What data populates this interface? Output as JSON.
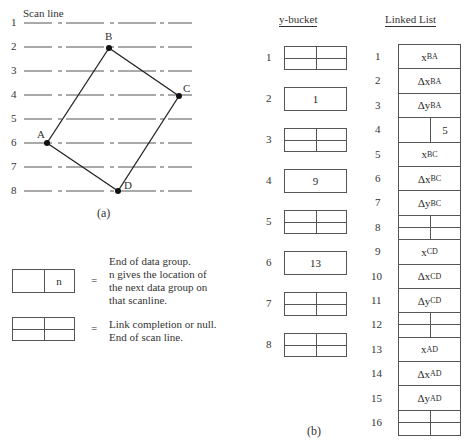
{
  "panel_a": {
    "caption": "(a)",
    "scan_line_label": "Scan line",
    "scan_lines": [
      "1",
      "2",
      "3",
      "4",
      "5",
      "6",
      "7",
      "8"
    ],
    "vertices": [
      {
        "name": "B",
        "x": 109,
        "y": 48
      },
      {
        "name": "C",
        "x": 179,
        "y": 96
      },
      {
        "name": "A",
        "x": 47,
        "y": 143
      },
      {
        "name": "D",
        "x": 118,
        "y": 191
      }
    ],
    "edges": [
      [
        "A",
        "B"
      ],
      [
        "B",
        "C"
      ],
      [
        "C",
        "D"
      ],
      [
        "D",
        "A"
      ]
    ]
  },
  "legend": {
    "end_group": {
      "cell_value": "n",
      "equals": "=",
      "lines": [
        "End of data group.",
        "n gives the location of",
        "the next data group on",
        "that scanline."
      ]
    },
    "link_null": {
      "equals": "=",
      "lines": [
        "Link completion or null.",
        "End of scan line."
      ]
    }
  },
  "panel_b": {
    "caption": "(b)",
    "y_bucket": {
      "title": "y-bucket",
      "rows": [
        {
          "index": "1",
          "type": "null",
          "value": ""
        },
        {
          "index": "2",
          "type": "value",
          "value": "1"
        },
        {
          "index": "3",
          "type": "null",
          "value": ""
        },
        {
          "index": "4",
          "type": "value",
          "value": "9"
        },
        {
          "index": "5",
          "type": "null",
          "value": ""
        },
        {
          "index": "6",
          "type": "value",
          "value": "13"
        },
        {
          "index": "7",
          "type": "null",
          "value": ""
        },
        {
          "index": "8",
          "type": "null",
          "value": ""
        }
      ]
    },
    "linked_list": {
      "title": "Linked List",
      "rows": [
        {
          "index": "1",
          "type": "text",
          "main": "x",
          "sub": "BA"
        },
        {
          "index": "2",
          "type": "text",
          "main": "Δx",
          "sub": "BA"
        },
        {
          "index": "3",
          "type": "text",
          "main": "Δy",
          "sub": "BA"
        },
        {
          "index": "4",
          "type": "link",
          "value": "5"
        },
        {
          "index": "5",
          "type": "text",
          "main": "x",
          "sub": "BC"
        },
        {
          "index": "6",
          "type": "text",
          "main": "Δx",
          "sub": "BC"
        },
        {
          "index": "7",
          "type": "text",
          "main": "Δy",
          "sub": "BC"
        },
        {
          "index": "8",
          "type": "null"
        },
        {
          "index": "9",
          "type": "text",
          "main": "x",
          "sub": "CD"
        },
        {
          "index": "10",
          "type": "text",
          "main": "Δx",
          "sub": "CD"
        },
        {
          "index": "11",
          "type": "text",
          "main": "Δy",
          "sub": "CD"
        },
        {
          "index": "12",
          "type": "null"
        },
        {
          "index": "13",
          "type": "text",
          "main": "x",
          "sub": "AD"
        },
        {
          "index": "14",
          "type": "text",
          "main": "Δx",
          "sub": "AD"
        },
        {
          "index": "15",
          "type": "text",
          "main": "Δy",
          "sub": "AD"
        },
        {
          "index": "16",
          "type": "null"
        }
      ]
    }
  }
}
